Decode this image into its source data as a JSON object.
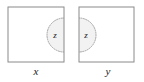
{
  "figure": {
    "type": "set-diagram",
    "canvas": {
      "width": 144,
      "height": 82,
      "background": "#ffffff"
    },
    "colors": {
      "square_stroke": "#8a8a8a",
      "circle_stroke": "#9a9a9a",
      "circle_fill": "#f2f2f2",
      "label_text": "#1a1a1a"
    },
    "squares": [
      {
        "name": "left-square",
        "label": "x",
        "x": 8,
        "y": 7,
        "width": 56,
        "height": 55,
        "region": {
          "label": "z",
          "shape": "semicircle",
          "center_x": 64,
          "center_y": 35,
          "radius": 17,
          "side": "left-half-inside-square",
          "style": "dotted-outline-shaded"
        }
      },
      {
        "name": "right-square",
        "label": "y",
        "x": 79,
        "y": 7,
        "width": 55,
        "height": 55,
        "region": {
          "label": "z",
          "shape": "semicircle",
          "center_x": 79,
          "center_y": 35,
          "radius": 17,
          "side": "right-half-inside-square",
          "style": "dotted-outline-shaded"
        }
      }
    ],
    "labels": {
      "left_square_label": "x",
      "right_square_label": "y",
      "left_region_label": "z",
      "right_region_label": "z"
    }
  }
}
